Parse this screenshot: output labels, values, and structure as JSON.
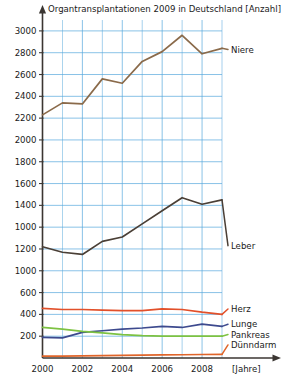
{
  "chart_data": {
    "type": "line",
    "title": "Organtransplantationen 2009 in Deutschland [Anzahl]",
    "xlabel": "[Jahre]",
    "ylabel": "",
    "x": [
      2000,
      2001,
      2002,
      2003,
      2004,
      2005,
      2006,
      2007,
      2008,
      2009
    ],
    "xtick_labels": [
      "2000",
      "2002",
      "2004",
      "2006",
      "2008"
    ],
    "xtick_values": [
      2000,
      2002,
      2004,
      2006,
      2008
    ],
    "ytick_labels": [
      "3000",
      "2800",
      "2600",
      "2400",
      "2200",
      "2000",
      "1800",
      "1600",
      "1400",
      "1000",
      "1200",
      "1000",
      "600",
      "400",
      "200"
    ],
    "ytick_values": [
      3000,
      2800,
      2600,
      2400,
      2200,
      2000,
      1800,
      1600,
      1400,
      1200,
      1000,
      800,
      600,
      400,
      200
    ],
    "ylim": [
      0,
      3100
    ],
    "xlim": [
      2000,
      2009
    ],
    "grid": true,
    "grid_color": "#56a8dd",
    "legend_position": "right-inline",
    "note": "Y-axis tick labels as printed contain errors: '1000' appears at the 1200 position and '1000' again at the 800 position.",
    "series": [
      {
        "name": "Niere",
        "color": "#8a6a4a",
        "label_x": 2009.15,
        "label_y": 2830,
        "values": [
          2230,
          2340,
          2330,
          2560,
          2520,
          2720,
          2810,
          2960,
          2790,
          2840
        ]
      },
      {
        "name": "Leber",
        "color": "#4a3f36",
        "label_x": 2009.15,
        "label_y": 1030,
        "values": [
          1020,
          970,
          950,
          1070,
          1110,
          1230,
          1350,
          1470,
          1410,
          1450
        ]
      },
      {
        "name": "Herz",
        "color": "#e2502a",
        "label_x": 2009.15,
        "label_y": 450,
        "values": [
          455,
          445,
          445,
          440,
          435,
          435,
          450,
          445,
          420,
          400
        ]
      },
      {
        "name": "Lunge",
        "color": "#3d4a8e",
        "label_x": 2009.15,
        "label_y": 310,
        "values": [
          190,
          185,
          235,
          250,
          265,
          275,
          290,
          280,
          310,
          290
        ]
      },
      {
        "name": "Pankreas",
        "color": "#7dc242",
        "label_x": 2009.15,
        "label_y": 215,
        "values": [
          280,
          265,
          245,
          230,
          215,
          205,
          200,
          200,
          200,
          200
        ]
      },
      {
        "name": "Dünndarm",
        "color": "#e0652a",
        "label_x": 2009.15,
        "label_y": 120,
        "values": [
          18,
          18,
          20,
          22,
          24,
          26,
          28,
          30,
          32,
          34
        ]
      }
    ]
  }
}
